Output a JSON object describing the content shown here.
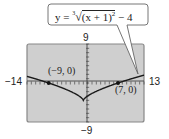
{
  "equation": {
    "text": "y = ∛((x + 1)²) − 4",
    "lhs": "y = ",
    "root_index": "3",
    "radicand": "(x + 1)",
    "exponent": "2",
    "tail": " − 4"
  },
  "window": {
    "xmin": -14,
    "xmax": 13,
    "ymin": -9,
    "ymax": 9,
    "xmin_label": "−14",
    "xmax_label": "13",
    "ymin_label": "−9",
    "ymax_label": "9"
  },
  "points": [
    {
      "label": "(−9, 0)",
      "x": -9,
      "y": 0
    },
    {
      "label": "(7, 0)",
      "x": 7,
      "y": 0
    }
  ],
  "colors": {
    "screen_bg": "#cfcfcf",
    "screen_border": "#888888",
    "curve": "#1a1a1a",
    "axis": "#333333",
    "bubble_border": "#666666",
    "bubble_bg": "#ffffff"
  },
  "chart_data": {
    "type": "line",
    "function": "y = ((x+1)^2)^(1/3) - 4",
    "xlim": [
      -14,
      13
    ],
    "ylim": [
      -9,
      9
    ],
    "x": [
      -14,
      -12,
      -10,
      -9,
      -7,
      -5,
      -3,
      -1,
      1,
      3,
      5,
      7,
      9,
      11,
      13
    ],
    "values": [
      1.53,
      0.95,
      0.33,
      0.0,
      -0.7,
      -1.7,
      -2.41,
      -4.0,
      -2.41,
      -1.48,
      -0.7,
      0.0,
      0.64,
      1.24,
      1.81
    ],
    "annotations": [
      "(−9, 0)",
      "(7, 0)"
    ],
    "tick_labels": {
      "x_left": "−14",
      "x_right": "13",
      "y_top": "9",
      "y_bottom": "−9"
    },
    "grid": false
  }
}
